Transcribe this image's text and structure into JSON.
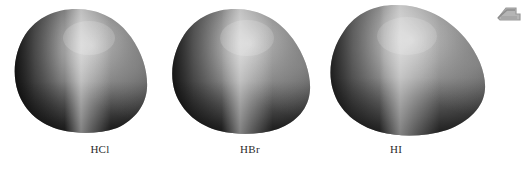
{
  "figure": {
    "background_color": "#ffffff",
    "width": 527,
    "height": 169,
    "kind": "electron-density-surface-illustration",
    "caption": ""
  },
  "molecules": [
    {
      "label": "HCl",
      "label_left": 60,
      "label_top": 143,
      "label_width": 80,
      "x": 13,
      "y": 8,
      "width": 136,
      "height": 126,
      "relative_size": "smallest",
      "highlight_color": "#c6c6c6",
      "shadow_color": "#141414",
      "midtone_color": "#5e5e5e",
      "rim_color": "#767676"
    },
    {
      "label": "HBr",
      "label_left": 210,
      "label_top": 143,
      "label_width": 80,
      "x": 171,
      "y": 8,
      "width": 141,
      "height": 128,
      "relative_size": "medium",
      "highlight_color": "#c9c9c9",
      "shadow_color": "#171717",
      "midtone_color": "#636363",
      "rim_color": "#7a7a7a"
    },
    {
      "label": "HI",
      "label_left": 356,
      "label_top": 143,
      "label_width": 80,
      "x": 329,
      "y": 4,
      "width": 158,
      "height": 134,
      "relative_size": "largest",
      "highlight_color": "#cccccc",
      "shadow_color": "#1b1b1b",
      "midtone_color": "#6a6a6a",
      "rim_color": "#808080"
    }
  ],
  "corner_glyph": {
    "name": "clipped-shape-artifact",
    "color": "#9a9a9a",
    "fill_color": "#b5b5b5"
  },
  "chart_data": {
    "type": "table",
    "xlabel": "",
    "ylabel": "",
    "categories": [
      "HCl",
      "HBr",
      "HI"
    ],
    "values": [
      136,
      141,
      158
    ],
    "series": [
      {
        "name": "Rendered surface width (px)",
        "values": [
          136,
          141,
          158
        ]
      },
      {
        "name": "Rendered surface height (px)",
        "values": [
          126,
          128,
          134
        ]
      }
    ],
    "legend_position": "none",
    "grid": false,
    "annotations": [
      "Each surface is a shaded teardrop-shaped electron-density (van der Waals) envelope.",
      "Size increases left to right: HCl < HBr < HI.",
      "A bright vertical specular highlight runs down the centre-left of every surface.",
      "Illumination comes from the upper-left; the left rim and lower edge are darkest."
    ]
  }
}
